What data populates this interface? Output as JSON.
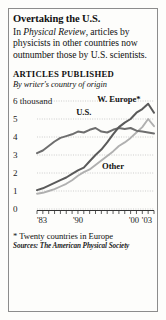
{
  "headline": "Overtaking the U.S.",
  "deck": {
    "pre": "In ",
    "italic": "Physical Review",
    "post": ", articles by physicists in other countries now outnumber those by U.S. scientists."
  },
  "section_title": "ARTICLES PUBLISHED",
  "section_subtitle": "By writer's country of origin",
  "footnote": "* Twenty countries in Europe",
  "source": "Sources: The American Physical Society",
  "colors": {
    "us_line": "#6e6e6e",
    "weurope_line": "#5a5a5a",
    "other_line": "#b0b0b0",
    "gridline": "#b9b9b9",
    "axis": "#333333",
    "frame": "#8c8c8c",
    "background": "#fdfdfb"
  },
  "chart_data": {
    "type": "line",
    "title": "ARTICLES PUBLISHED",
    "subtitle": "By writer's country of origin",
    "xlabel": "",
    "ylabel": "thousand",
    "ylim": [
      0,
      6
    ],
    "xlim": [
      1983,
      2003
    ],
    "yticks": [
      0,
      1,
      2,
      3,
      4,
      5,
      6
    ],
    "ytick_labels": [
      "0",
      "1",
      "2",
      "3",
      "4",
      "5",
      "6 thousand"
    ],
    "xticks": [
      1983,
      1990,
      2000,
      2003
    ],
    "xtick_labels": [
      "'83",
      "'90",
      "'00",
      "'03"
    ],
    "grid": true,
    "legend": "inline-labels",
    "x": [
      1983,
      1984,
      1985,
      1986,
      1987,
      1988,
      1989,
      1990,
      1991,
      1992,
      1993,
      1994,
      1995,
      1996,
      1997,
      1998,
      1999,
      2000,
      2001,
      2002,
      2003
    ],
    "series": [
      {
        "name": "U.S.",
        "color": "#6e6e6e",
        "label_x": 1991,
        "label_y": 5.25,
        "values": [
          3.1,
          3.25,
          3.5,
          3.75,
          3.95,
          4.05,
          4.15,
          4.3,
          4.25,
          4.4,
          4.5,
          4.3,
          4.25,
          4.4,
          4.5,
          4.45,
          4.5,
          4.35,
          4.3,
          4.25,
          4.2
        ]
      },
      {
        "name": "W. Europe*",
        "color": "#5a5a5a",
        "label_x": 1997,
        "label_y": 5.95,
        "values": [
          1.05,
          1.15,
          1.3,
          1.45,
          1.6,
          1.75,
          1.95,
          2.15,
          2.3,
          2.65,
          3.0,
          3.3,
          3.7,
          4.15,
          4.55,
          4.8,
          5.0,
          5.35,
          5.55,
          5.85,
          5.35
        ]
      },
      {
        "name": "Other",
        "color": "#b0b0b0",
        "label_x": 1996,
        "label_y": 2.25,
        "values": [
          0.85,
          0.9,
          1.0,
          1.1,
          1.25,
          1.4,
          1.6,
          1.85,
          2.05,
          2.2,
          2.45,
          2.7,
          2.95,
          3.2,
          3.5,
          3.7,
          3.95,
          4.25,
          4.55,
          5.0,
          4.6
        ]
      }
    ]
  }
}
